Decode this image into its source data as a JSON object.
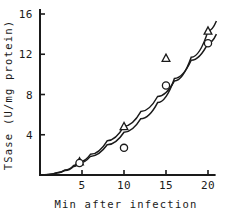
{
  "chart_data": {
    "type": "line",
    "title": "",
    "xlabel": "Min after infection",
    "ylabel": "TSase (U/mg protein)",
    "xlim": [
      0,
      21.5
    ],
    "ylim": [
      0,
      16.6
    ],
    "xticks": [
      5,
      10,
      15,
      20
    ],
    "xtick_labels": [
      "5",
      "10",
      "15",
      "20"
    ],
    "yticks": [
      4,
      8,
      12,
      16
    ],
    "ytick_labels": [
      "4",
      "8",
      "12",
      "16"
    ],
    "grid": false,
    "legend": "none",
    "series": [
      {
        "name": "triangle-series",
        "marker": "open-triangle",
        "x": [
          4.7,
          10.0,
          15.0,
          20.0
        ],
        "values": [
          1.3,
          4.8,
          11.6,
          14.3
        ],
        "curve_x": [
          0,
          1.0,
          2.0,
          3.0,
          4.0,
          4.7,
          6.0,
          8.0,
          10.0,
          12.0,
          14.0,
          16.0,
          18.0,
          20.0,
          21.0
        ],
        "curve_y": [
          0,
          0.06,
          0.22,
          0.5,
          0.95,
          1.3,
          2.05,
          3.4,
          4.85,
          6.3,
          7.8,
          9.35,
          11.7,
          14.3,
          15.3
        ]
      },
      {
        "name": "circle-series",
        "marker": "open-circle",
        "x": [
          4.7,
          10.0,
          15.0,
          20.0
        ],
        "values": [
          1.2,
          2.7,
          8.9,
          13.1
        ],
        "curve_x": [
          0,
          1.0,
          2.0,
          3.0,
          4.0,
          4.7,
          6.0,
          8.0,
          10.0,
          12.0,
          14.0,
          16.0,
          18.0,
          20.0,
          21.0
        ],
        "curve_y": [
          0,
          0.05,
          0.2,
          0.45,
          0.85,
          1.2,
          1.85,
          3.0,
          4.25,
          5.6,
          7.2,
          9.6,
          11.4,
          13.1,
          14.0
        ]
      }
    ],
    "offline_points": [
      {
        "series": "triangle-series",
        "x": 15.0,
        "y": 11.6,
        "marker": "open-triangle"
      },
      {
        "series": "circle-series",
        "x": 10.0,
        "y": 2.7,
        "marker": "open-circle"
      }
    ]
  },
  "axes": {
    "y_axis_title": "TSase (U/mg protein)",
    "x_axis_title": "Min after infection"
  },
  "colors": {
    "ink": "#1a1a1a",
    "background": "#ffffff"
  }
}
